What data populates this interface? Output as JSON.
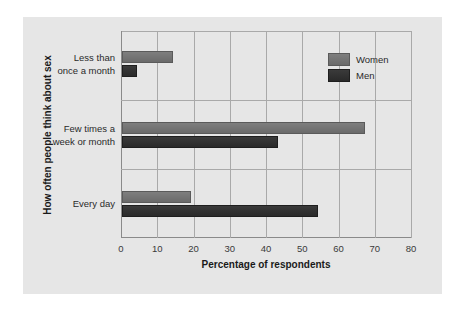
{
  "chart_data": {
    "type": "bar",
    "orientation": "horizontal",
    "title": "",
    "xlabel": "Percentage of respondents",
    "ylabel": "How often people think about sex",
    "categories": [
      "Less than once a month",
      "Few times a week or month",
      "Every day"
    ],
    "category_labels": [
      [
        "Less than",
        "once a month"
      ],
      [
        "Few times a",
        "week or month"
      ],
      [
        "Every day"
      ]
    ],
    "series": [
      {
        "name": "Women",
        "values": [
          14,
          67,
          19
        ],
        "color": "#737373"
      },
      {
        "name": "Men",
        "values": [
          4,
          43,
          54
        ],
        "color": "#2f2f2f"
      }
    ],
    "xlim": [
      0,
      80
    ],
    "xticks": [
      "0",
      "10",
      "20",
      "30",
      "40",
      "50",
      "60",
      "70",
      "80"
    ],
    "grid": true,
    "legend_position": "upper right"
  },
  "legend": {
    "items": [
      {
        "label": "Women"
      },
      {
        "label": "Men"
      }
    ]
  }
}
